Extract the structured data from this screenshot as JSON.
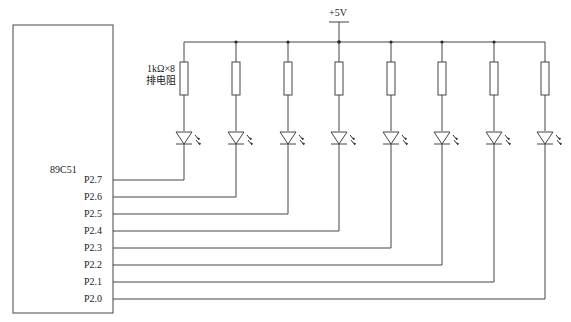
{
  "diagram": {
    "type": "circuit-schematic",
    "chip": {
      "label": "89C51",
      "pins": [
        "P2.7",
        "P2.6",
        "P2.5",
        "P2.4",
        "P2.3",
        "P2.2",
        "P2.1",
        "P2.0"
      ]
    },
    "supply": {
      "label": "+5V"
    },
    "resistor": {
      "value_label": "1kΩ×8",
      "type_label": "排电阻"
    },
    "branches": 8,
    "colors": {
      "line": "#444444",
      "text": "#222222",
      "background": "#ffffff"
    }
  }
}
